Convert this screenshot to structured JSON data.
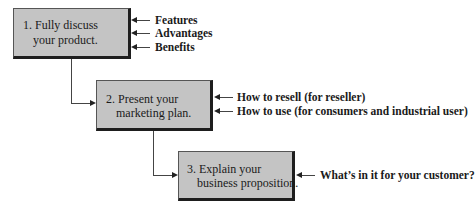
{
  "steps": [
    {
      "line1": "1. Fully discuss",
      "line2": "your product.",
      "inputs": [
        "Features",
        "Advantages",
        "Benefits"
      ]
    },
    {
      "line1": "2. Present your",
      "line2": "marketing plan.",
      "inputs": [
        "How to resell (for reseller)",
        "How to use (for consumers and industrial user)"
      ]
    },
    {
      "line1": "3. Explain your",
      "line2": "business proposition.",
      "inputs": [
        "What’s in it for your customer?"
      ]
    }
  ],
  "colors": {
    "box_fill": "#c4c4c4",
    "box_shadow": "#1e1e1e",
    "line": "#444444"
  }
}
